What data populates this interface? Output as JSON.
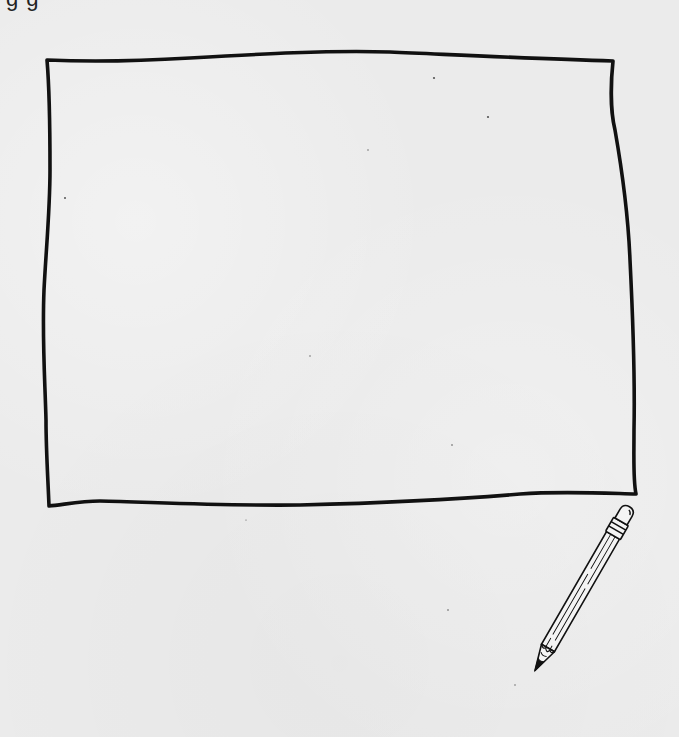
{
  "page": {
    "top_cut_text": "g    g",
    "background_color": "#ebebeb",
    "ink_color": "#111111"
  },
  "frame": {
    "label": "blank drawing frame",
    "corners": {
      "top_left": [
        47,
        59
      ],
      "top_right": [
        613,
        60
      ],
      "bottom_right": [
        636,
        493
      ],
      "bottom_left": [
        48,
        505
      ]
    }
  },
  "pencil": {
    "label": "pencil illustration",
    "eraser_end": [
      626,
      503
    ],
    "tip": [
      529,
      690
    ]
  }
}
